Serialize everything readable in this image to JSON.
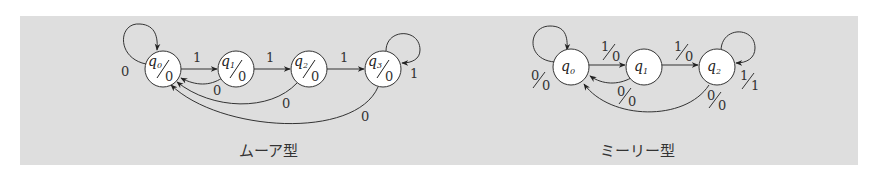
{
  "diagrams": [
    {
      "title": "ムーア型",
      "type": "moore",
      "states": [
        {
          "name": "q",
          "sub": "0",
          "output": "0"
        },
        {
          "name": "q",
          "sub": "1",
          "output": "0"
        },
        {
          "name": "q",
          "sub": "2",
          "output": "0"
        },
        {
          "name": "q",
          "sub": "3",
          "output": "0"
        }
      ],
      "transitions": [
        {
          "from": "q0",
          "to": "q0",
          "label": "0"
        },
        {
          "from": "q0",
          "to": "q1",
          "label": "1"
        },
        {
          "from": "q1",
          "to": "q2",
          "label": "1"
        },
        {
          "from": "q2",
          "to": "q3",
          "label": "1"
        },
        {
          "from": "q1",
          "to": "q0",
          "label": "0"
        },
        {
          "from": "q2",
          "to": "q0",
          "label": "0"
        },
        {
          "from": "q3",
          "to": "q0",
          "label": "0"
        },
        {
          "from": "q3",
          "to": "q3",
          "label": "1"
        }
      ]
    },
    {
      "title": "ミーリー型",
      "type": "mealy",
      "states": [
        {
          "name": "q",
          "sub": "0"
        },
        {
          "name": "q",
          "sub": "1"
        },
        {
          "name": "q",
          "sub": "2"
        }
      ],
      "transitions": [
        {
          "from": "q0",
          "to": "q0",
          "input": "0",
          "output": "0"
        },
        {
          "from": "q0",
          "to": "q1",
          "input": "1",
          "output": "0"
        },
        {
          "from": "q1",
          "to": "q2",
          "input": "1",
          "output": "0"
        },
        {
          "from": "q1",
          "to": "q0",
          "input": "0",
          "output": "0"
        },
        {
          "from": "q2",
          "to": "q0",
          "input": "0",
          "output": "0"
        },
        {
          "from": "q2",
          "to": "q2",
          "input": "1",
          "output": "1"
        }
      ]
    }
  ]
}
